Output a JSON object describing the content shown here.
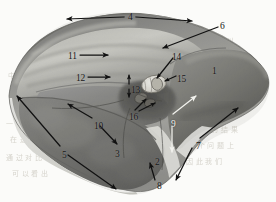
{
  "figure": {
    "type": "anatomical-illustration",
    "background_color": "#fbfbf9",
    "ink_color": "#141414",
    "light_label_color": "#f4f4f0"
  },
  "labels": [
    {
      "id": "1",
      "text": "1",
      "x": 212,
      "y": 67,
      "style": "dark",
      "name": "label-1"
    },
    {
      "id": "2",
      "text": "2",
      "x": 155,
      "y": 158,
      "style": "dark",
      "name": "label-2"
    },
    {
      "id": "3",
      "text": "3",
      "x": 115,
      "y": 150,
      "style": "dark",
      "name": "label-3"
    },
    {
      "id": "4",
      "text": "4",
      "x": 128,
      "y": 13,
      "style": "dark",
      "name": "label-4"
    },
    {
      "id": "5",
      "text": "5",
      "x": 62,
      "y": 151,
      "style": "dark",
      "name": "label-5"
    },
    {
      "id": "6",
      "text": "6",
      "x": 220,
      "y": 22,
      "style": "dark",
      "name": "label-6"
    },
    {
      "id": "7",
      "text": "7",
      "x": 196,
      "y": 142,
      "style": "dark",
      "name": "label-7"
    },
    {
      "id": "8",
      "text": "8",
      "x": 157,
      "y": 182,
      "style": "dark",
      "name": "label-8"
    },
    {
      "id": "9",
      "text": "9",
      "x": 171,
      "y": 120,
      "style": "light",
      "name": "label-9"
    },
    {
      "id": "10",
      "text": "10",
      "x": 94,
      "y": 122,
      "style": "dark",
      "name": "label-10"
    },
    {
      "id": "11",
      "text": "11",
      "x": 68,
      "y": 52,
      "style": "dark",
      "name": "label-11"
    },
    {
      "id": "12",
      "text": "12",
      "x": 76,
      "y": 74,
      "style": "dark",
      "name": "label-12"
    },
    {
      "id": "13",
      "text": "13",
      "x": 131,
      "y": 86,
      "style": "dark",
      "name": "label-13"
    },
    {
      "id": "14",
      "text": "14",
      "x": 172,
      "y": 53,
      "style": "dark",
      "name": "label-14"
    },
    {
      "id": "15",
      "text": "15",
      "x": 177,
      "y": 75,
      "style": "dark",
      "name": "label-15"
    },
    {
      "id": "16",
      "text": "16",
      "x": 129,
      "y": 113,
      "style": "dark",
      "name": "label-16"
    }
  ],
  "ghost_text": [
    {
      "text": "比 如 可 以",
      "x": 198,
      "y": 35,
      "name": "ghost-text-line"
    },
    {
      "text": "中 国 学 术",
      "x": 8,
      "y": 70,
      "name": "ghost-text-line"
    },
    {
      "text": "有 可 能 会",
      "x": 196,
      "y": 108,
      "name": "ghost-text-line"
    },
    {
      "text": "分 析 的 结 果",
      "x": 192,
      "y": 124,
      "name": "ghost-text-line"
    },
    {
      "text": "这 个 问 题 上",
      "x": 188,
      "y": 140,
      "name": "ghost-text-line"
    },
    {
      "text": "因 此 我 们",
      "x": 186,
      "y": 156,
      "name": "ghost-text-line"
    },
    {
      "text": "一 般 来 说",
      "x": 6,
      "y": 118,
      "name": "ghost-text-line"
    },
    {
      "text": "在 这 里",
      "x": 10,
      "y": 134,
      "name": "ghost-text-line"
    },
    {
      "text": "通 过 对 比",
      "x": 6,
      "y": 152,
      "name": "ghost-text-line"
    },
    {
      "text": "可 以 看 出",
      "x": 12,
      "y": 168,
      "name": "ghost-text-line"
    }
  ],
  "annotations": {
    "arrows": [
      {
        "id": "arrow-4",
        "kind": "double-head-horizontal",
        "name": "arrow-span-4"
      },
      {
        "id": "arrow-6",
        "kind": "leader-line",
        "name": "arrow-leader-6"
      },
      {
        "id": "arrow-14",
        "kind": "leader-line",
        "name": "arrow-leader-14"
      },
      {
        "id": "arrow-15",
        "kind": "leader-line",
        "name": "arrow-leader-15"
      },
      {
        "id": "arrow-16",
        "kind": "leader-line-pair",
        "name": "arrow-leader-16"
      },
      {
        "id": "arrow-13",
        "kind": "double-head-vertical",
        "name": "arrow-span-13"
      },
      {
        "id": "arrow-11",
        "kind": "single-head-right",
        "name": "arrow-pointer-11"
      },
      {
        "id": "arrow-12",
        "kind": "single-head-right",
        "name": "arrow-pointer-12"
      },
      {
        "id": "arrow-10",
        "kind": "double-head-diagonal",
        "name": "arrow-span-10"
      },
      {
        "id": "arrow-5",
        "kind": "double-head-diagonal",
        "name": "arrow-span-5"
      },
      {
        "id": "arrow-2",
        "kind": "single-head-up",
        "name": "arrow-pointer-2"
      },
      {
        "id": "arrow-9",
        "kind": "double-head-vertical-white",
        "name": "arrow-span-9"
      },
      {
        "id": "arrow-7",
        "kind": "double-head-diagonal",
        "name": "arrow-span-7"
      }
    ]
  }
}
